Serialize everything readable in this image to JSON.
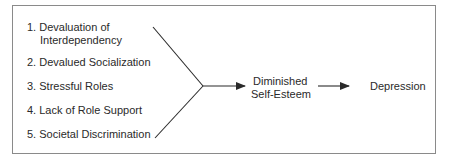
{
  "diagram": {
    "causes": [
      {
        "number": "1.",
        "label_line1": "Devaluation of",
        "label_line2": "Interdependency"
      },
      {
        "number": "2.",
        "label": "Devalued Socialization"
      },
      {
        "number": "3.",
        "label": "Stressful Roles"
      },
      {
        "number": "4.",
        "label": "Lack of Role Support"
      },
      {
        "number": "5.",
        "label": "Societal Discrimination"
      }
    ],
    "mediator": {
      "line1": "Diminished",
      "line2": "Self-Esteem"
    },
    "outcome": {
      "label": "Depression"
    },
    "colors": {
      "line": "#2a2a2a",
      "border": "#8a8a8a",
      "text": "#2a2a2a"
    }
  }
}
